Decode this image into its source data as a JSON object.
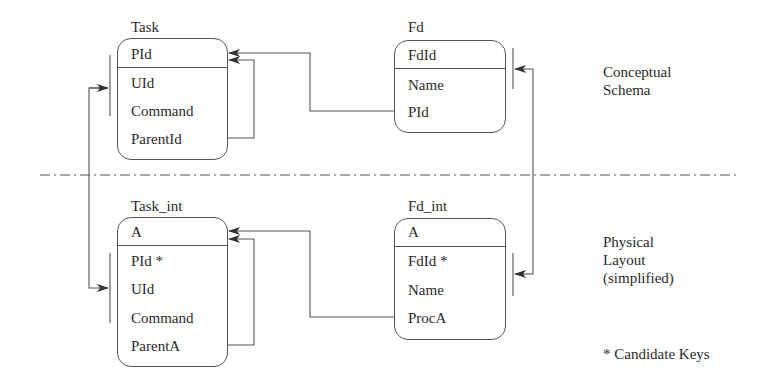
{
  "diagram": {
    "layers": {
      "conceptual": [
        "Conceptual",
        "Schema"
      ],
      "physical": [
        "Physical",
        "Layout",
        "(simplified)"
      ]
    },
    "legend": "* Candidate Keys",
    "entities": {
      "task": {
        "title": "Task",
        "key_field": "PId",
        "fields": [
          "UId",
          "Command",
          "ParentId"
        ]
      },
      "fd": {
        "title": "Fd",
        "key_field": "FdId",
        "fields": [
          "Name",
          "PId"
        ]
      },
      "task_int": {
        "title": "Task_int",
        "key_field": "A",
        "fields": [
          "PId *",
          "UId",
          "Command",
          "ParentA"
        ]
      },
      "fd_int": {
        "title": "Fd_int",
        "key_field": "A",
        "fields": [
          "FdId *",
          "Name",
          "ProcA"
        ]
      }
    },
    "relationships": [
      {
        "from": "Fd.PId",
        "to": "Task.PId"
      },
      {
        "from": "Task.ParentId",
        "to": "Task.PId"
      },
      {
        "from": "Fd_int.ProcA",
        "to": "Task_int.A"
      },
      {
        "from": "Task_int.ParentA",
        "to": "Task_int.A"
      },
      {
        "from": "Task_int",
        "to": "Task",
        "type": "layer-mapping"
      },
      {
        "from": "Fd_int",
        "to": "Fd",
        "type": "layer-mapping"
      }
    ],
    "colors": {
      "line": "#555555",
      "text": "#2a2a2a",
      "background": "#ffffff"
    }
  }
}
